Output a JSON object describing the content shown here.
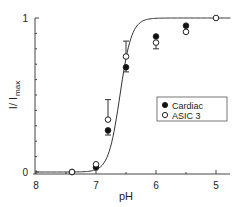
{
  "chart_data": {
    "type": "scatter",
    "title": "",
    "xlabel": "pH",
    "ylabel": "I / I max",
    "ylabel_main": "I/ I",
    "ylabel_sub": "max",
    "xlim": [
      8,
      4.75
    ],
    "ylim": [
      0,
      1
    ],
    "x_reversed": true,
    "grid": false,
    "legend_position": "right-middle",
    "x_ticks": [
      "8",
      "7",
      "6",
      "5"
    ],
    "y_ticks": [
      "0",
      "1"
    ],
    "series": [
      {
        "name": "Cardiac",
        "marker": "filled-circle",
        "points": [
          {
            "x": 7.4,
            "y": 0.0
          },
          {
            "x": 7.0,
            "y": 0.03
          },
          {
            "x": 6.8,
            "y": 0.27,
            "err": 0.03
          },
          {
            "x": 6.5,
            "y": 0.68,
            "err": 0.03
          },
          {
            "x": 6.0,
            "y": 0.88
          },
          {
            "x": 5.5,
            "y": 0.95
          }
        ]
      },
      {
        "name": "ASIC 3",
        "marker": "open-circle",
        "points": [
          {
            "x": 7.4,
            "y": 0.0
          },
          {
            "x": 7.0,
            "y": 0.05
          },
          {
            "x": 6.8,
            "y": 0.34,
            "err": 0.13
          },
          {
            "x": 6.5,
            "y": 0.75,
            "err": 0.1
          },
          {
            "x": 6.0,
            "y": 0.84,
            "err": 0.04
          },
          {
            "x": 5.5,
            "y": 0.91
          },
          {
            "x": 5.0,
            "y": 1.0
          }
        ]
      }
    ],
    "fit_curve": {
      "type": "hill",
      "pH50": 6.6,
      "slope": 4.5,
      "label": "fit"
    }
  }
}
